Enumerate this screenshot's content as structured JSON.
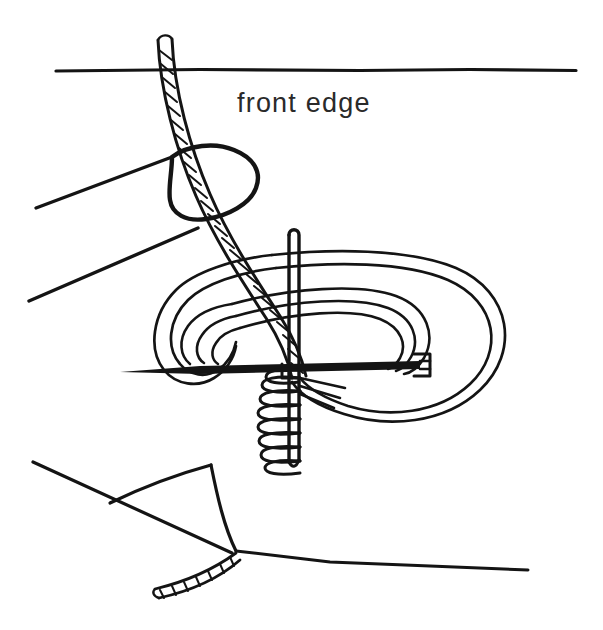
{
  "figure": {
    "domain_kind": "line-art instructional diagram",
    "background_color": "#ffffff",
    "ink_color": "#141414",
    "canvas": {
      "width": 603,
      "height": 630
    },
    "labels": [
      {
        "id": "front-edge-label",
        "text": "front edge",
        "x": 237,
        "y": 112,
        "font_size": 27,
        "color": "#2a2a2a"
      }
    ],
    "elements": [
      {
        "id": "front-edge-line",
        "name": "front-edge-line",
        "description": "long horizontal fabric edge line across the top of the drawing",
        "stroke_width": 3.2
      },
      {
        "id": "thumb",
        "name": "thumb-outline",
        "description": "rounded thumb tip pressing the thread near the top left",
        "stroke_width": 4.2
      },
      {
        "id": "finger",
        "name": "finger-outline",
        "description": "two long diagonal lines forming the finger below the thumb",
        "stroke_width": 3.4
      },
      {
        "id": "working-thread",
        "name": "working-thread",
        "description": "twisted cord thread running from top of image down past the thumb into the stitch",
        "stroke_width": 3.0,
        "texture": "twisted-cord-hatching"
      },
      {
        "id": "vertical-bar",
        "name": "stitch-bar",
        "description": "vertical bar of the stitch which the loops wrap around",
        "stroke_width": 3.4
      },
      {
        "id": "coil-wrap",
        "name": "coil-wrap",
        "description": "series of eight small horizontal coils wrapped around the lower stitch bar",
        "loop_count": 8,
        "stroke_width": 3.0
      },
      {
        "id": "needle",
        "name": "needle",
        "description": "long straight needle entering from the left with a pointed tip and an eye on the right",
        "stroke_width": 2.8
      },
      {
        "id": "loop-left",
        "name": "thread-loop-left",
        "description": "doubled thread loop curling at the left of the stitch",
        "stroke_width": 2.6
      },
      {
        "id": "loop-right",
        "name": "thread-loop-right",
        "description": "large doubled thread loop curving around to the right of the stitch",
        "stroke_width": 2.6
      },
      {
        "id": "fabric-fold",
        "name": "fabric-fold",
        "description": "folded fabric corner in the lower left of the drawing",
        "stroke_width": 3.2
      },
      {
        "id": "lower-edge-line",
        "name": "lower-fabric-edge",
        "description": "long lower fabric edge running to the right side",
        "stroke_width": 3.0
      },
      {
        "id": "thread-tail",
        "name": "thread-tail",
        "description": "short twisted thread tail emerging below the fabric fold",
        "stroke_width": 3.0,
        "texture": "twisted-cord-hatching"
      }
    ]
  }
}
